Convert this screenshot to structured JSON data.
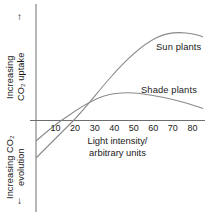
{
  "axes": {
    "y_upper_label": "Increasing\nCO  uptake",
    "y_upper_label_line1": "Increasing",
    "y_upper_label_line2": "CO₂ uptake",
    "y_lower_label_line1": "Increasing CO₂",
    "y_lower_label_line2": "evolution",
    "arrow_up": "↑",
    "arrow_down": "↓",
    "x_label_line1": "Light intensity/",
    "x_label_line2": "arbitrary units"
  },
  "labels": {
    "sun": "Sun plants",
    "shade": "Shade plants"
  },
  "colors": {
    "axis": "#6e6e6e",
    "curve": "#8a8a8a",
    "text": "#1a1a1a",
    "background": "#ffffff"
  },
  "chart_data": {
    "type": "line",
    "title": "",
    "xlabel": "Light intensity/ arbitrary units",
    "ylabel": "Increasing CO2 uptake / Increasing CO2 evolution",
    "xlim": [
      0,
      85
    ],
    "ylim": [
      -40,
      60
    ],
    "grid": false,
    "legend": "inline-annotations",
    "xticks": [
      10,
      20,
      30,
      40,
      50,
      60,
      70,
      80
    ],
    "yticks": [],
    "zero_line": 0,
    "annotations": [
      {
        "text": "Sun plants",
        "x": 64,
        "y": 42
      },
      {
        "text": "Shade plants",
        "x": 55,
        "y": 20
      }
    ],
    "series": [
      {
        "name": "Sun plants",
        "x": [
          0,
          5,
          10,
          15,
          20,
          25,
          30,
          35,
          40,
          45,
          50,
          55,
          60,
          65,
          70,
          75,
          80
        ],
        "y": [
          -38,
          -29,
          -20,
          -11,
          -2,
          7,
          15,
          22,
          28,
          33,
          37,
          40,
          42,
          43,
          43,
          42.5,
          42
        ],
        "compensation_point": 21
      },
      {
        "name": "Shade plants",
        "x": [
          0,
          5,
          10,
          15,
          20,
          25,
          30,
          35,
          40,
          45,
          50,
          55,
          60,
          65,
          70,
          75,
          80
        ],
        "y": [
          -19,
          -11,
          -3,
          4,
          9,
          13,
          16,
          18,
          19.5,
          20,
          20,
          19.5,
          19,
          18,
          16.5,
          14.5,
          12
        ],
        "compensation_point": 12
      }
    ]
  }
}
